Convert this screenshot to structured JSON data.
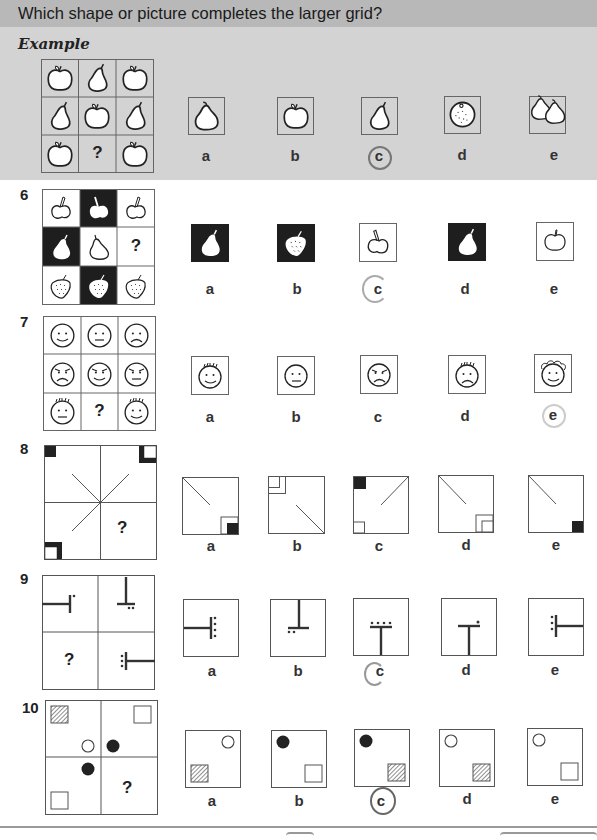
{
  "header": {
    "title": "Which shape or picture completes the larger grid?"
  },
  "example": {
    "label": "Example",
    "grid": [
      [
        "apple",
        "pear",
        "apple"
      ],
      [
        "pear",
        "apple",
        "pear"
      ],
      [
        "apple",
        "?",
        "apple"
      ]
    ],
    "missing": "?",
    "options": [
      {
        "label": "a",
        "content": "large pear"
      },
      {
        "label": "b",
        "content": "apple"
      },
      {
        "label": "c",
        "content": "pear",
        "circled": true
      },
      {
        "label": "d",
        "content": "orange"
      },
      {
        "label": "e",
        "content": "two pears"
      }
    ],
    "answer": "c"
  },
  "questions": [
    {
      "number": "6",
      "missing": "?",
      "grid": [
        [
          "cherry outline",
          "cherry white-on-black",
          "cherry outline"
        ],
        [
          "pear white-on-black",
          "pear outline",
          "?"
        ],
        [
          "strawberry outline",
          "strawberry white-on-black",
          "strawberry outline"
        ]
      ],
      "options": [
        {
          "label": "a",
          "content": "pear white-on-black"
        },
        {
          "label": "b",
          "content": "strawberry white-on-black"
        },
        {
          "label": "c",
          "content": "cherry outline",
          "circled": true
        },
        {
          "label": "d",
          "content": "pear white-on-black (stalk right)"
        },
        {
          "label": "e",
          "content": "apple outline"
        }
      ],
      "answer": "c"
    },
    {
      "number": "7",
      "missing": "?",
      "grid": [
        [
          "smile",
          "neutral",
          "frown"
        ],
        [
          "angry frown",
          "angry smile",
          "angry neutral"
        ],
        [
          "hair neutral",
          "?",
          "hair smile"
        ]
      ],
      "options": [
        {
          "label": "a",
          "content": "hair smile"
        },
        {
          "label": "b",
          "content": "neutral"
        },
        {
          "label": "c",
          "content": "angry frown"
        },
        {
          "label": "d",
          "content": "hair frown"
        },
        {
          "label": "e",
          "content": "curly hair smile",
          "circled": true
        }
      ],
      "answer": "e"
    },
    {
      "number": "8",
      "missing": "?",
      "options": [
        {
          "label": "a",
          "content": "diagonal top-left, black square in open square bottom-right"
        },
        {
          "label": "b",
          "content": "nested squares top-left, diagonal bottom-right"
        },
        {
          "label": "c",
          "content": "black square top-left, diagonal top-right, square bottom-left"
        },
        {
          "label": "d",
          "content": "diagonal top-left, nested squares bottom-right"
        },
        {
          "label": "e",
          "content": "diagonal top-left, black square bottom-right"
        }
      ]
    },
    {
      "number": "9",
      "missing": "?",
      "options": [
        {
          "label": "a",
          "content": "T pointing left with 4 dots right"
        },
        {
          "label": "b",
          "content": "T inverted with 2 dots"
        },
        {
          "label": "c",
          "content": "T upright with 4 dots",
          "circled": true
        },
        {
          "label": "d",
          "content": "T upright with 1 dot"
        },
        {
          "label": "e",
          "content": "T pointing right with 3 dots"
        }
      ],
      "answer": "c"
    },
    {
      "number": "10",
      "missing": "?",
      "options": [
        {
          "label": "a",
          "content": "open circle top-right, hatched square bottom-left"
        },
        {
          "label": "b",
          "content": "black circle top-left, open square bottom-right"
        },
        {
          "label": "c",
          "content": "black circle top-left, hatched square bottom-right",
          "circled": true
        },
        {
          "label": "d",
          "content": "open circle top-left, hatched square bottom-right"
        },
        {
          "label": "e",
          "content": "open circle top-left, open square bottom-right"
        }
      ],
      "answer": "c"
    }
  ],
  "colors": {
    "header_bg": "#b8b8b8",
    "example_bg": "#d3d3d3",
    "answer_ring": "#777777",
    "ink": "#222222"
  }
}
